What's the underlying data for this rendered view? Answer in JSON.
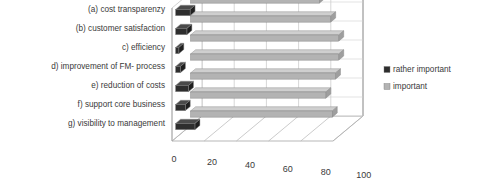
{
  "chart_data": {
    "type": "bar",
    "orientation": "horizontal",
    "style": "3d",
    "title": "",
    "xlabel": "",
    "ylabel": "",
    "categories": [
      "(a) cost transparenzy",
      "(b) customer satisfaction",
      "c) efficiency",
      "d) improvement of FM- process",
      "e) reduction of costs",
      "f) support core business",
      "g) visibility to management"
    ],
    "series": [
      {
        "name": "rather important",
        "color": "#2e2e2e",
        "values": [
          9,
          7,
          2,
          3,
          8,
          6,
          12
        ]
      },
      {
        "name": "important",
        "color": "#b3b3b3",
        "values": [
          80,
          87,
          92,
          92,
          90,
          84,
          88
        ]
      }
    ],
    "xticks": [
      0,
      20,
      40,
      60,
      80,
      100
    ],
    "xlim": [
      0,
      100
    ],
    "grid": true,
    "legend_position": "right"
  },
  "legend": {
    "items": [
      {
        "label": "rather important",
        "marker": "dark-square-marker"
      },
      {
        "label": "important",
        "marker": "light-square-marker"
      }
    ]
  },
  "axis": {
    "tick_labels": [
      "0",
      "20",
      "40",
      "60",
      "80",
      "100"
    ]
  }
}
